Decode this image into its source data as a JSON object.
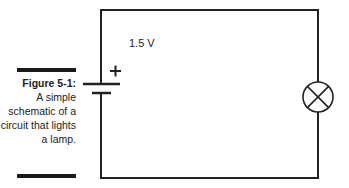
{
  "caption": {
    "figure_label": "Figure 5-1:",
    "text": "A simple schematic of a circuit that lights a lamp."
  },
  "circuit": {
    "voltage_label": "1.5 V",
    "battery_polarity": "+",
    "components": [
      "battery",
      "lamp"
    ],
    "wire_color": "#222222"
  }
}
